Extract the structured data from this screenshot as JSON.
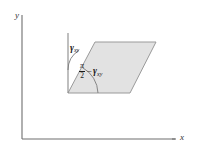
{
  "figure": {
    "type": "shear-strain-diagram",
    "background_color": "#ffffff",
    "axes": {
      "x_label": "x",
      "y_label": "y",
      "axis_color": "#6e6e6e",
      "origin": [
        22,
        139
      ],
      "x_end": [
        175,
        139
      ],
      "y_end": [
        22,
        15
      ]
    },
    "shape": {
      "name": "sheared-element",
      "fill_color": "#e2e2e2",
      "stroke_color": "#9a9a9a",
      "vertices": [
        [
          68,
          93
        ],
        [
          130,
          93
        ],
        [
          156,
          42
        ],
        [
          95,
          42
        ]
      ]
    },
    "reference_line": {
      "name": "vertical-reference",
      "color": "#8a8a8a",
      "from": [
        68,
        33
      ],
      "to": [
        68,
        93
      ]
    },
    "annotations": {
      "shear_angle_label": {
        "symbol": "γ",
        "subscript": "xy"
      },
      "interior_angle_label": {
        "numerator": "π",
        "denominator": "2",
        "operator": "−",
        "symbol": "γ",
        "subscript": "xy"
      }
    },
    "arcs": {
      "shear_arc_color": "#7a7a7a",
      "interior_arc_color": "#7a7a7a"
    }
  }
}
